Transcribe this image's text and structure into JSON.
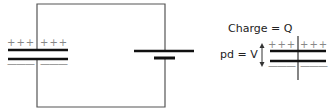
{
  "diagram": {
    "type": "capacitor-circuit",
    "circuit": {
      "capacitor_plus_left": "+++",
      "capacitor_plus_right": "+++",
      "capacitor_minus_left": "———",
      "capacitor_minus_right": "———",
      "components": [
        "capacitor",
        "battery"
      ]
    },
    "detail": {
      "charge_label": "Charge = Q",
      "pd_label": "pd = V",
      "plus_left": "+++",
      "plus_right": "+++",
      "minus_left": "———",
      "minus_right": "———"
    },
    "colors": {
      "wire": "#555555",
      "plate": "#111111",
      "sign": "#888888"
    }
  }
}
